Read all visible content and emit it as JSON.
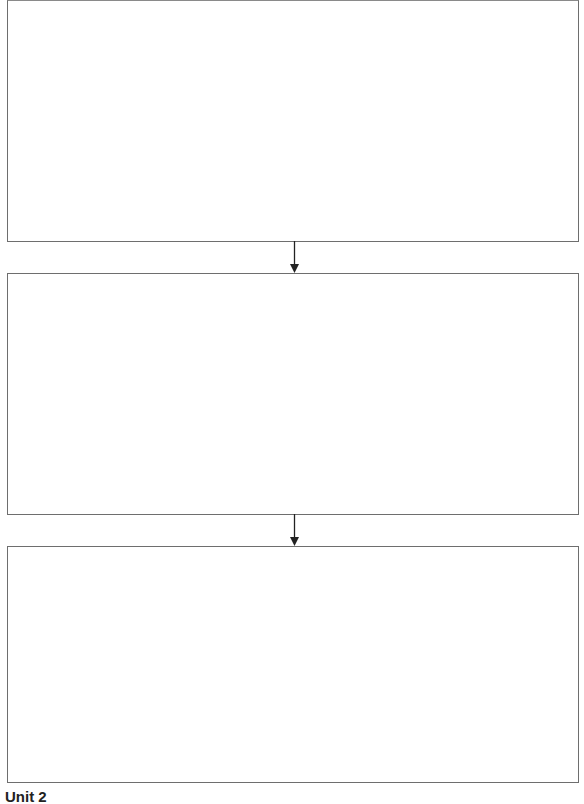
{
  "diagram": {
    "type": "flowchart",
    "orientation": "vertical",
    "boxes": [
      {
        "id": "box1",
        "text": ""
      },
      {
        "id": "box2",
        "text": ""
      },
      {
        "id": "box3",
        "text": ""
      }
    ],
    "arrows": [
      {
        "from": "box1",
        "to": "box2",
        "direction": "down"
      },
      {
        "from": "box2",
        "to": "box3",
        "direction": "down"
      }
    ],
    "colors": {
      "border": "#6e6e6e",
      "arrow": "#222222",
      "background": "#ffffff"
    }
  },
  "caption": {
    "text": "Unit 2"
  }
}
